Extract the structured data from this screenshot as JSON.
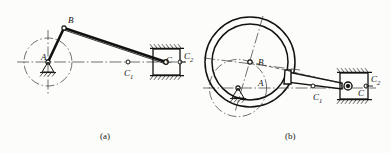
{
  "figure": {
    "background_color": "#fcfcfa",
    "line_color": "#111111",
    "centerline_color": "#444444"
  },
  "subfigures": [
    {
      "id": "a",
      "caption": "(a)",
      "caption_x": 100,
      "caption_y": 131,
      "type": "crank-slider-mechanism",
      "labels": [
        {
          "name": "point-label-A",
          "text": "A",
          "sub": "",
          "x": 41,
          "y": 52
        },
        {
          "name": "point-label-B",
          "text": "B",
          "sub": "",
          "x": 68,
          "y": 15
        },
        {
          "name": "point-label-C1",
          "text": "C",
          "sub": "1",
          "x": 124,
          "y": 68
        },
        {
          "name": "point-label-C",
          "text": "C",
          "sub": "",
          "x": 166,
          "y": 55
        },
        {
          "name": "point-label-C2",
          "text": "C",
          "sub": "2",
          "x": 184,
          "y": 51
        }
      ],
      "joints": {
        "A": {
          "x": 48,
          "y": 62
        },
        "B": {
          "x": 64,
          "y": 28
        },
        "C1": {
          "x": 128,
          "y": 62
        },
        "C": {
          "x": 166,
          "y": 62
        },
        "C2": {
          "x": 180,
          "y": 62
        }
      },
      "crank_circle": {
        "cx": 48,
        "cy": 62,
        "r": 24
      },
      "slider_block": {
        "x": 153,
        "y": 49,
        "w": 27,
        "h": 26
      }
    },
    {
      "id": "b",
      "caption": "(b)",
      "caption_x": 285,
      "caption_y": 131,
      "type": "eccentric-disc-mechanism",
      "labels": [
        {
          "name": "point-label-A",
          "text": "A",
          "sub": "",
          "x": 258,
          "y": 78
        },
        {
          "name": "point-label-B",
          "text": "B",
          "sub": "",
          "x": 258,
          "y": 57
        },
        {
          "name": "point-label-C1",
          "text": "C",
          "sub": "1",
          "x": 313,
          "y": 92
        },
        {
          "name": "point-label-C",
          "text": "C",
          "sub": "",
          "x": 358,
          "y": 88
        },
        {
          "name": "point-label-C2",
          "text": "C",
          "sub": "2",
          "x": 371,
          "y": 74
        },
        {
          "name": "point-label-Cprime",
          "text": "C",
          "sub": "",
          "x": 358,
          "y": 88
        }
      ],
      "joints": {
        "A": {
          "x": 238,
          "y": 88
        },
        "B": {
          "x": 250,
          "y": 62
        },
        "C1": {
          "x": 313,
          "y": 86
        },
        "C": {
          "x": 353,
          "y": 86
        },
        "C2": {
          "x": 369,
          "y": 86
        }
      },
      "disc_inner": {
        "cx": 250,
        "cy": 62,
        "r": 38
      },
      "disc_outer": {
        "cx": 250,
        "cy": 62,
        "r": 45
      },
      "slider_block": {
        "x": 340,
        "y": 73,
        "w": 28,
        "h": 26
      }
    }
  ]
}
